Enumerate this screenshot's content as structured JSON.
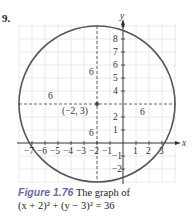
{
  "problem_number": "9.",
  "diagram": {
    "type": "circle-graph",
    "equation": "(x + 2)^2 + (y - 3)^2 = 36",
    "center": {
      "x": -2,
      "y": 3,
      "label": "(−2, 3)"
    },
    "radius": 6,
    "radius_labels": [
      "6",
      "6",
      "6",
      "6"
    ],
    "x_axis": {
      "label": "x",
      "ticks": [
        "−7",
        "−6",
        "−5",
        "−4",
        "−3",
        "−2",
        "−1",
        "1",
        "2",
        "3"
      ]
    },
    "y_axis": {
      "label": "y",
      "ticks": [
        "8",
        "7",
        "6",
        "5",
        "4",
        "2",
        "1",
        "−1",
        "−2"
      ]
    },
    "colors": {
      "circle": "#555555",
      "grid": "#e4e4e4",
      "axis": "#333333",
      "caption_label": "#6a6a9a"
    }
  },
  "caption": {
    "label": "Figure 1.76",
    "text_line1": "The graph of",
    "text_line2": "(x + 2)² + (y − 3)² = 36"
  }
}
